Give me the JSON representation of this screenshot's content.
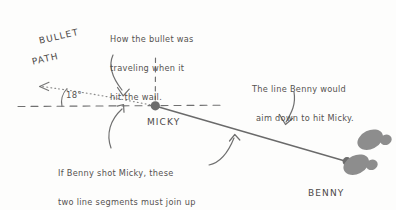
{
  "diagram": {
    "title_words": {
      "bullet": "BULLET",
      "path": "PATH"
    },
    "angle": "18°",
    "labels": {
      "micky": "MICKY",
      "benny": "BENNY"
    },
    "annotations": {
      "top_note": {
        "line1": "How the bullet was",
        "line2": "traveling when it",
        "line3": "hit the wall."
      },
      "right_note": {
        "line1": "The line Benny would",
        "line2": "aim down to hit Micky."
      },
      "bottom_note": {
        "line1": "If Benny shot Micky, these",
        "line2": "two line segments must join up",
        "line3": "to make a straight line."
      }
    },
    "colors": {
      "ink": "#4a4a4a",
      "note_ink": "#555250",
      "line": "#6b6b6b",
      "footprint": "#8a8a8a",
      "background": "#fdfdfc"
    },
    "points": {
      "micky_label": "MICKY",
      "benny_label": "BENNY"
    }
  }
}
